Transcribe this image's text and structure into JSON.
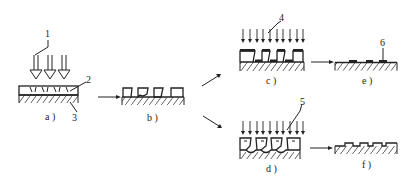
{
  "figure": {
    "panels": [
      {
        "id": "a",
        "label": "a )",
        "callouts": [
          "1",
          "2",
          "3"
        ]
      },
      {
        "id": "b",
        "label": "b )"
      },
      {
        "id": "c",
        "label": "c )",
        "callouts": [
          "4"
        ]
      },
      {
        "id": "d",
        "label": "d )",
        "callouts": [
          "5"
        ]
      },
      {
        "id": "e",
        "label": "e )",
        "callouts": [
          "6"
        ]
      },
      {
        "id": "f",
        "label": "f )"
      }
    ],
    "callout_labels": {
      "c1": "1",
      "c2": "2",
      "c3": "3",
      "c4": "4",
      "c5": "5",
      "c6": "6"
    },
    "colors": {
      "line": "#222222",
      "background": "#ffffff"
    }
  }
}
